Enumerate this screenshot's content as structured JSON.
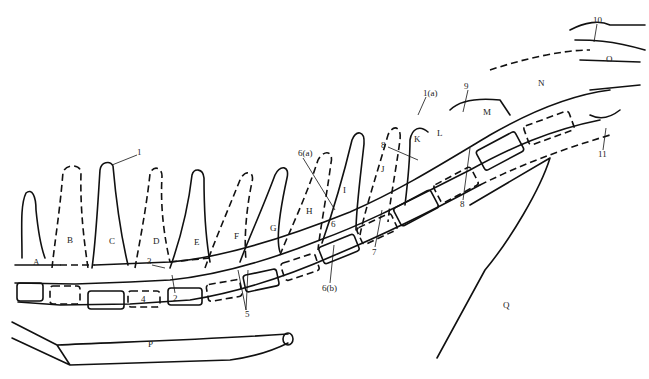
{
  "diagram": {
    "vertebra_letters": [
      {
        "id": "A",
        "x": 33,
        "y": 258
      },
      {
        "id": "B",
        "x": 67,
        "y": 236
      },
      {
        "id": "C",
        "x": 109,
        "y": 237
      },
      {
        "id": "D",
        "x": 153,
        "y": 237
      },
      {
        "id": "E",
        "x": 194,
        "y": 238
      },
      {
        "id": "F",
        "x": 234,
        "y": 232
      },
      {
        "id": "G",
        "x": 270,
        "y": 224
      },
      {
        "id": "H",
        "x": 306,
        "y": 207
      },
      {
        "id": "I",
        "x": 343,
        "y": 186
      },
      {
        "id": "J",
        "x": 381,
        "y": 165
      },
      {
        "id": "K",
        "x": 414,
        "y": 139
      },
      {
        "id": "L",
        "x": 437,
        "y": 133
      },
      {
        "id": "M",
        "x": 483,
        "y": 111
      },
      {
        "id": "N",
        "x": 538,
        "y": 82
      },
      {
        "id": "O",
        "x": 606,
        "y": 57
      }
    ],
    "number_labels": [
      {
        "id": "1",
        "x": 137,
        "y": 152
      },
      {
        "id": "1(a)",
        "x": 423,
        "y": 93
      },
      {
        "id": "2",
        "x": 175,
        "y": 295
      },
      {
        "id": "3",
        "x": 149,
        "y": 262
      },
      {
        "id": "4",
        "x": 143,
        "y": 300
      },
      {
        "id": "5",
        "x": 246,
        "y": 313
      },
      {
        "id": "6",
        "x": 331,
        "y": 223
      },
      {
        "id": "6(a)",
        "x": 298,
        "y": 152
      },
      {
        "id": "6(b)",
        "x": 323,
        "y": 286
      },
      {
        "id": "7",
        "x": 373,
        "y": 249
      },
      {
        "id": "8",
        "x": 382,
        "y": 144
      },
      {
        "id": "8",
        "x": 460,
        "y": 203
      },
      {
        "id": "9",
        "x": 465,
        "y": 86
      },
      {
        "id": "10",
        "x": 594,
        "y": 20
      },
      {
        "id": "11",
        "x": 599,
        "y": 152
      }
    ],
    "element_labels": [
      {
        "id": "P",
        "x": 148,
        "y": 343
      },
      {
        "id": "Q",
        "x": 504,
        "y": 304
      }
    ]
  }
}
